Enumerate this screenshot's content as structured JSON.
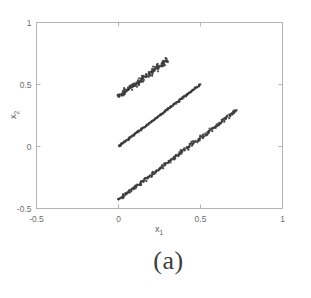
{
  "figure": {
    "caption": "(a)"
  },
  "chart_data": {
    "type": "scatter",
    "title": "",
    "xlabel": "x",
    "xlabel_sub": "1",
    "ylabel": "x",
    "ylabel_sub": "2",
    "xlim": [
      -0.5,
      1.0
    ],
    "ylim": [
      -0.5,
      1.0
    ],
    "xticks": [
      -0.5,
      0,
      0.5,
      1
    ],
    "yticks": [
      -0.5,
      0,
      0.5,
      1
    ],
    "xticklabels": [
      "-0.5",
      "0",
      "0.5",
      "1"
    ],
    "yticklabels": [
      "-0.5",
      "0",
      "0.5",
      "1"
    ],
    "grid": false,
    "legend": false,
    "marker_color": "#3a3a3a",
    "axis_color": "#b4b4b4",
    "series": [
      {
        "name": "cluster-top",
        "x_start": 0.0,
        "y_start": 0.4,
        "x_end": 0.3,
        "y_end": 0.7,
        "slope": 1.0,
        "intercept": 0.4,
        "n_points": 150,
        "thickness": 0.02,
        "jitter": 0.006
      },
      {
        "name": "cluster-middle",
        "x_start": 0.0,
        "y_start": 0.0,
        "x_end": 0.5,
        "y_end": 0.5,
        "slope": 1.0,
        "intercept": 0.0,
        "n_points": 150,
        "thickness": 0.006,
        "jitter": 0.008
      },
      {
        "name": "cluster-bottom",
        "x_start": 0.0,
        "y_start": -0.43,
        "x_end": 0.72,
        "y_end": 0.29,
        "slope": 1.0,
        "intercept": -0.43,
        "n_points": 230,
        "thickness": 0.013,
        "jitter": 0.01
      }
    ]
  }
}
